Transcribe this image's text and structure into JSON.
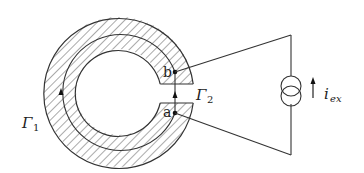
{
  "diagram": {
    "labels": {
      "gamma1": "Γ",
      "gamma1_sub": "1",
      "gamma2": "Γ",
      "gamma2_sub": "2",
      "point_a": "a",
      "point_b": "b",
      "current": "i",
      "current_sub": "ex"
    },
    "colors": {
      "stroke": "#333333",
      "hatch": "#555555",
      "background": "#ffffff"
    }
  }
}
